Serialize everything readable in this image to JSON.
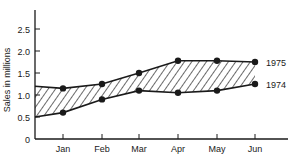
{
  "chart_data": {
    "type": "line",
    "title": "",
    "xlabel": "",
    "ylabel": "Sales in millions",
    "categories": [
      "Jan",
      "Feb",
      "Mar",
      "Apr",
      "May",
      "Jun"
    ],
    "yticks": [
      "0",
      "0.5",
      "1.0",
      "1.5",
      "2.0",
      "2.5"
    ],
    "ylim": [
      0,
      2.8
    ],
    "grid": false,
    "legend_position": "right-inline",
    "series": [
      {
        "name": "1975",
        "start_value": 1.2,
        "values": [
          1.15,
          1.25,
          1.5,
          1.78,
          1.78,
          1.75
        ]
      },
      {
        "name": "1974",
        "start_value": 0.5,
        "values": [
          0.6,
          0.9,
          1.1,
          1.05,
          1.1,
          1.25
        ]
      }
    ],
    "annotations": [
      "Hatched area between 1975 and 1974 lines"
    ],
    "colors": {
      "line": "#1a1a1a",
      "fill_hatch": "#1a1a1a",
      "background": "#ffffff"
    }
  }
}
